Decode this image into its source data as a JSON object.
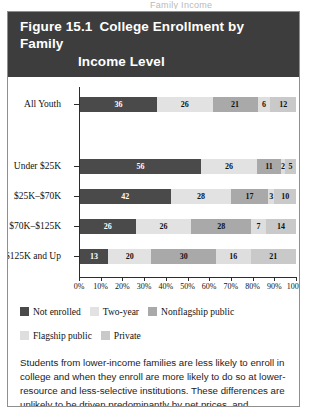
{
  "page_bleed_text": "Family Income",
  "figure": {
    "number_label": "Figure 15.1",
    "title_line1": "College Enrollment by Family",
    "title_line2": "Income Level",
    "header_bg": "#3d3d3d",
    "header_fg": "#ffffff"
  },
  "legend": {
    "items": [
      {
        "label": "Not enrolled",
        "color": "#4a4a4a"
      },
      {
        "label": "Two-year",
        "color": "#e2e2e2"
      },
      {
        "label": "Nonflagship public",
        "color": "#a9a9a9"
      },
      {
        "label": "Flagship public",
        "color": "#dedede"
      },
      {
        "label": "Private",
        "color": "#c9c9c9"
      }
    ]
  },
  "caption": {
    "text": "Students from lower-income families are less likely to enroll in college and when they enroll are more likely to do so at lower-resource and less-selective institutions. These differences are unlikely to be driven predominantly by net prices, and information differences by family income likely play some role in generating these inequities.",
    "source": "Data from: NLSY97"
  },
  "chart_data": {
    "type": "bar",
    "orientation": "horizontal",
    "stacked": true,
    "stack_total": 100,
    "title": "College Enrollment by Family Income Level",
    "xlabel": "",
    "ylabel": "",
    "xlim": [
      0,
      100
    ],
    "grid": false,
    "legend_position": "bottom",
    "xticks": [
      "0%",
      "10%",
      "20%",
      "30%",
      "40%",
      "50%",
      "60%",
      "70%",
      "80%",
      "90%",
      "100%"
    ],
    "xtick_values": [
      0,
      10,
      20,
      30,
      40,
      50,
      60,
      70,
      80,
      90,
      100
    ],
    "categories": [
      "All Youth",
      "Under $25K",
      "$25K–$70K",
      "$70K–$125K",
      "$125K and Up"
    ],
    "series": [
      {
        "name": "Not enrolled",
        "color": "#4a4a4a",
        "label_color": "#ffffff",
        "values": [
          36,
          56,
          42,
          26,
          13
        ]
      },
      {
        "name": "Two-year",
        "color": "#e2e2e2",
        "label_color": "#111111",
        "values": [
          26,
          26,
          28,
          26,
          20
        ]
      },
      {
        "name": "Nonflagship public",
        "color": "#a9a9a9",
        "label_color": "#111111",
        "values": [
          21,
          11,
          17,
          28,
          30
        ]
      },
      {
        "name": "Flagship public",
        "color": "#dedede",
        "label_color": "#111111",
        "values": [
          6,
          2,
          3,
          7,
          16
        ]
      },
      {
        "name": "Private",
        "color": "#c9c9c9",
        "label_color": "#111111",
        "values": [
          12,
          5,
          10,
          14,
          21
        ]
      }
    ]
  }
}
